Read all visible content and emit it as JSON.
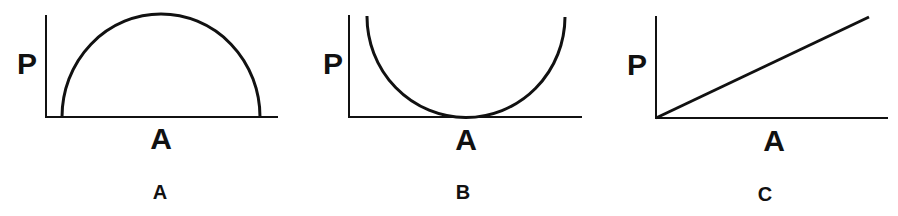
{
  "figure": {
    "panels": [
      {
        "id": "A",
        "panel_label": "A",
        "y_axis_label": "P",
        "x_axis_label": "A",
        "curve_shape": "inverted semicircle (dome)"
      },
      {
        "id": "B",
        "panel_label": "B",
        "y_axis_label": "P",
        "x_axis_label": "A",
        "curve_shape": "U-shaped semicircle touching x-axis at center"
      },
      {
        "id": "C",
        "panel_label": "C",
        "y_axis_label": "P",
        "x_axis_label": "A",
        "curve_shape": "straight line from origin with positive slope"
      }
    ],
    "colors": {
      "line": "#111111",
      "background": "#ffffff"
    }
  }
}
